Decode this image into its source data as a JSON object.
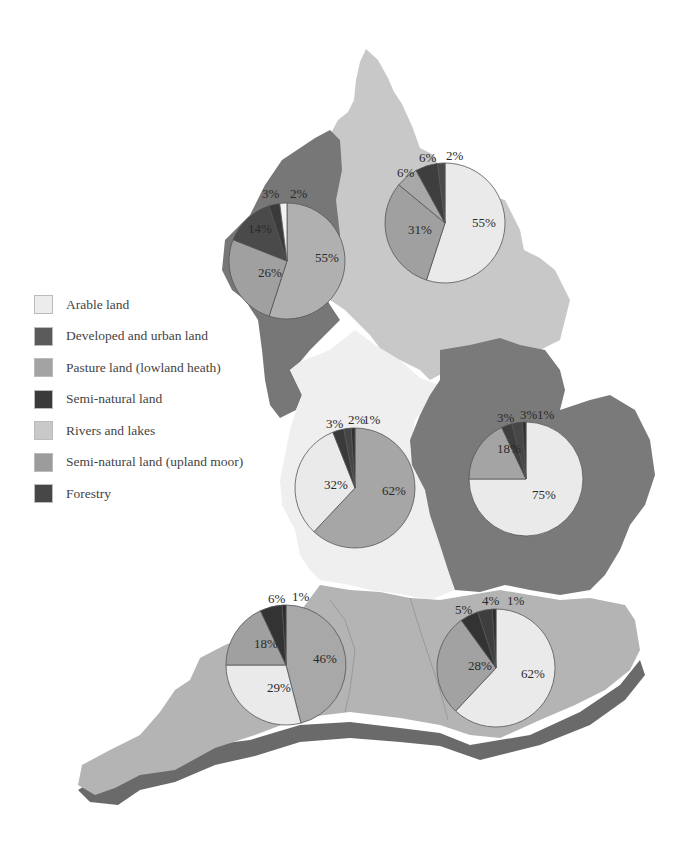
{
  "legend": {
    "items": [
      {
        "key": "arable",
        "label": "Arable land",
        "color": "#ececec"
      },
      {
        "key": "developed",
        "label": "Developed and urban land",
        "color": "#5b5b5b"
      },
      {
        "key": "pasture",
        "label": "Pasture land (lowland heath)",
        "color": "#a3a3a3"
      },
      {
        "key": "seminatural",
        "label": "Semi-natural land",
        "color": "#3a3a3a"
      },
      {
        "key": "rivers",
        "label": "Rivers and lakes",
        "color": "#c9c9c9"
      },
      {
        "key": "moor",
        "label": "Semi-natural land (upland moor)",
        "color": "#9c9c9c"
      },
      {
        "key": "forestry",
        "label": "Forestry",
        "color": "#474747"
      }
    ]
  },
  "chart_data": {
    "type": "pie",
    "title": "",
    "legend_position": "left",
    "charts": [
      {
        "region": "North West",
        "cx": 287,
        "cy": 261,
        "r": 58,
        "slices": [
          {
            "label": "55%",
            "value": 55,
            "category": "Pasture land (lowland heath)"
          },
          {
            "label": "26%",
            "value": 26,
            "category": "Semi-natural land (upland moor)"
          },
          {
            "label": "14%",
            "value": 14,
            "category": "Developed and urban land"
          },
          {
            "label": "3%",
            "value": 3,
            "category": "Semi-natural land"
          },
          {
            "label": "2%",
            "value": 2,
            "category": "Arable land"
          }
        ]
      },
      {
        "region": "North East / Yorkshire",
        "cx": 445,
        "cy": 223,
        "r": 60,
        "slices": [
          {
            "label": "55%",
            "value": 55,
            "category": "Arable land"
          },
          {
            "label": "31%",
            "value": 31,
            "category": "Semi-natural land (upland moor)"
          },
          {
            "label": "6%",
            "value": 6,
            "category": "Pasture land (lowland heath)"
          },
          {
            "label": "6%",
            "value": 6,
            "category": "Developed and urban land"
          },
          {
            "label": "2%",
            "value": 2,
            "category": "Forestry"
          }
        ]
      },
      {
        "region": "Midlands",
        "cx": 355,
        "cy": 488,
        "r": 60,
        "slices": [
          {
            "label": "62%",
            "value": 62,
            "category": "Pasture land (lowland heath)"
          },
          {
            "label": "32%",
            "value": 32,
            "category": "Arable land"
          },
          {
            "label": "3%",
            "value": 3,
            "category": "Developed and urban land"
          },
          {
            "label": "2%",
            "value": 2,
            "category": "Semi-natural land"
          },
          {
            "label": "1%",
            "value": 1,
            "category": "Forestry"
          }
        ]
      },
      {
        "region": "East Anglia",
        "cx": 526,
        "cy": 479,
        "r": 57,
        "slices": [
          {
            "label": "75%",
            "value": 75,
            "category": "Arable land"
          },
          {
            "label": "18%",
            "value": 18,
            "category": "Pasture land (lowland heath)"
          },
          {
            "label": "3%",
            "value": 3,
            "category": "Developed and urban land"
          },
          {
            "label": "3%",
            "value": 3,
            "category": "Semi-natural land"
          },
          {
            "label": "1%",
            "value": 1,
            "category": "Forestry"
          }
        ]
      },
      {
        "region": "South West",
        "cx": 286,
        "cy": 665,
        "r": 60,
        "slices": [
          {
            "label": "46%",
            "value": 46,
            "category": "Pasture land (lowland heath)"
          },
          {
            "label": "29%",
            "value": 29,
            "category": "Arable land"
          },
          {
            "label": "18%",
            "value": 18,
            "category": "Semi-natural land (upland moor)"
          },
          {
            "label": "6%",
            "value": 6,
            "category": "Developed and urban land"
          },
          {
            "label": "1%",
            "value": 1,
            "category": "Forestry"
          }
        ]
      },
      {
        "region": "South East",
        "cx": 496,
        "cy": 668,
        "r": 59,
        "slices": [
          {
            "label": "62%",
            "value": 62,
            "category": "Arable land"
          },
          {
            "label": "28%",
            "value": 28,
            "category": "Pasture land (lowland heath)"
          },
          {
            "label": "5%",
            "value": 5,
            "category": "Developed and urban land"
          },
          {
            "label": "4%",
            "value": 4,
            "category": "Semi-natural land"
          },
          {
            "label": "1%",
            "value": 1,
            "category": "Forestry"
          }
        ]
      }
    ]
  },
  "pies": [
    {
      "name": "pie-north-west",
      "cx": 287,
      "cy": 261,
      "r": 58,
      "slices": [
        {
          "v": 55,
          "c": "#b0b0b0",
          "t": "55%",
          "tx": 315,
          "ty": 262
        },
        {
          "v": 26,
          "c": "#a0a0a0",
          "t": "26%",
          "tx": 258,
          "ty": 277
        },
        {
          "v": 14,
          "c": "#4a4a4a",
          "t": "14%",
          "tx": 248,
          "ty": 233
        },
        {
          "v": 3,
          "c": "#3a3a3a",
          "t": "3%",
          "tx": 262,
          "ty": 198
        },
        {
          "v": 2,
          "c": "#f2f2f2",
          "t": "2%",
          "tx": 290,
          "ty": 198
        }
      ]
    },
    {
      "name": "pie-north-east",
      "cx": 445,
      "cy": 223,
      "r": 60,
      "slices": [
        {
          "v": 55,
          "c": "#eaeaea",
          "t": "55%",
          "tx": 472,
          "ty": 227
        },
        {
          "v": 31,
          "c": "#a0a0a0",
          "t": "31%",
          "tx": 408,
          "ty": 234
        },
        {
          "v": 6,
          "c": "#a8a8a8",
          "t": "6%",
          "tx": 397,
          "ty": 177
        },
        {
          "v": 6,
          "c": "#3e3e3e",
          "t": "6%",
          "tx": 419,
          "ty": 162
        },
        {
          "v": 2,
          "c": "#4a4a4a",
          "t": "2%",
          "tx": 446,
          "ty": 160
        }
      ]
    },
    {
      "name": "pie-midlands",
      "cx": 355,
      "cy": 488,
      "r": 60,
      "slices": [
        {
          "v": 62,
          "c": "#a6a6a6",
          "t": "62%",
          "tx": 382,
          "ty": 495
        },
        {
          "v": 32,
          "c": "#eaeaea",
          "t": "32%",
          "tx": 324,
          "ty": 489
        },
        {
          "v": 3,
          "c": "#3a3a3a",
          "t": "3%",
          "tx": 326,
          "ty": 428
        },
        {
          "v": 2,
          "c": "#454545",
          "t": "2%",
          "tx": 348,
          "ty": 424
        },
        {
          "v": 1,
          "c": "#303030",
          "t": "1%",
          "tx": 363,
          "ty": 424
        }
      ]
    },
    {
      "name": "pie-east-anglia",
      "cx": 526,
      "cy": 479,
      "r": 57,
      "slices": [
        {
          "v": 75,
          "c": "#eaeaea",
          "t": "75%",
          "tx": 532,
          "ty": 499
        },
        {
          "v": 18,
          "c": "#a4a4a4",
          "t": "18%",
          "tx": 497,
          "ty": 453
        },
        {
          "v": 3,
          "c": "#3e3e3e",
          "t": "3%",
          "tx": 497,
          "ty": 422
        },
        {
          "v": 3,
          "c": "#474747",
          "t": "3%",
          "tx": 520,
          "ty": 419
        },
        {
          "v": 1,
          "c": "#303030",
          "t": "1%",
          "tx": 537,
          "ty": 419
        }
      ]
    },
    {
      "name": "pie-south-west",
      "cx": 286,
      "cy": 665,
      "r": 60,
      "slices": [
        {
          "v": 46,
          "c": "#a8a8a8",
          "t": "46%",
          "tx": 313,
          "ty": 663
        },
        {
          "v": 29,
          "c": "#eaeaea",
          "t": "29%",
          "tx": 267,
          "ty": 692
        },
        {
          "v": 18,
          "c": "#a0a0a0",
          "t": "18%",
          "tx": 254,
          "ty": 648
        },
        {
          "v": 6,
          "c": "#333333",
          "t": "6%",
          "tx": 268,
          "ty": 603
        },
        {
          "v": 1,
          "c": "#2a2a2a",
          "t": "1%",
          "tx": 292,
          "ty": 601
        }
      ]
    },
    {
      "name": "pie-south-east",
      "cx": 496,
      "cy": 668,
      "r": 59,
      "slices": [
        {
          "v": 62,
          "c": "#eaeaea",
          "t": "62%",
          "tx": 521,
          "ty": 678
        },
        {
          "v": 28,
          "c": "#a2a2a2",
          "t": "28%",
          "tx": 468,
          "ty": 670
        },
        {
          "v": 5,
          "c": "#333333",
          "t": "5%",
          "tx": 455,
          "ty": 614
        },
        {
          "v": 4,
          "c": "#3e3e3e",
          "t": "4%",
          "tx": 482,
          "ty": 605
        },
        {
          "v": 1,
          "c": "#2a2a2a",
          "t": "1%",
          "tx": 507,
          "ty": 605
        }
      ]
    }
  ],
  "map": {
    "colors": {
      "north_east": "#c8c8c8",
      "north_west": "#777777",
      "midlands": "#efefef",
      "east": "#7a7a7a",
      "south": "#b4b4b4",
      "shadow": "#6a6a6a"
    }
  }
}
